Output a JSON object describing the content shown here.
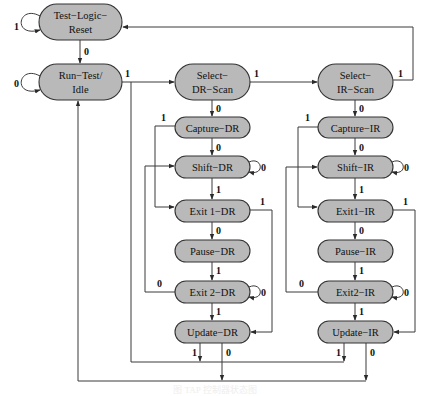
{
  "diagram": {
    "type": "state-machine",
    "states": [
      {
        "id": "tlr",
        "lines": [
          "Test−Logic−",
          "Reset"
        ]
      },
      {
        "id": "rti",
        "lines": [
          "Run−Test/",
          "Idle"
        ]
      },
      {
        "id": "sdr",
        "lines": [
          "Select−",
          "DR−Scan"
        ]
      },
      {
        "id": "cdr",
        "lines": [
          "Capture−DR"
        ]
      },
      {
        "id": "shdr",
        "lines": [
          "Shift−DR"
        ]
      },
      {
        "id": "e1dr",
        "lines": [
          "Exit 1−DR"
        ]
      },
      {
        "id": "pdr",
        "lines": [
          "Pause−DR"
        ]
      },
      {
        "id": "e2dr",
        "lines": [
          "Exit 2−DR"
        ]
      },
      {
        "id": "udr",
        "lines": [
          "Update−DR"
        ]
      },
      {
        "id": "sir",
        "lines": [
          "Select−",
          "IR−Scan"
        ]
      },
      {
        "id": "cir",
        "lines": [
          "Capture−IR"
        ]
      },
      {
        "id": "shir",
        "lines": [
          "Shift−IR"
        ]
      },
      {
        "id": "e1ir",
        "lines": [
          "Exit1−IR"
        ]
      },
      {
        "id": "pir",
        "lines": [
          "Pause−IR"
        ]
      },
      {
        "id": "e2ir",
        "lines": [
          "Exit2−IR"
        ]
      },
      {
        "id": "uir",
        "lines": [
          "Update−IR"
        ]
      }
    ],
    "transitions": [
      {
        "from": "tlr",
        "to": "tlr",
        "label": "1"
      },
      {
        "from": "tlr",
        "to": "rti",
        "label": "0"
      },
      {
        "from": "rti",
        "to": "rti",
        "label": "0"
      },
      {
        "from": "rti",
        "to": "sdr",
        "label": "1"
      },
      {
        "from": "sdr",
        "to": "sir",
        "label": "1"
      },
      {
        "from": "sdr",
        "to": "cdr",
        "label": "0"
      },
      {
        "from": "sir",
        "to": "tlr",
        "label": "1"
      },
      {
        "from": "sir",
        "to": "cir",
        "label": "0"
      },
      {
        "from": "cdr",
        "to": "shdr",
        "label": "0"
      },
      {
        "from": "cdr",
        "to": "e1dr",
        "label": "1"
      },
      {
        "from": "shdr",
        "to": "shdr",
        "label": "0"
      },
      {
        "from": "shdr",
        "to": "e1dr",
        "label": "1"
      },
      {
        "from": "e1dr",
        "to": "pdr",
        "label": "0"
      },
      {
        "from": "e1dr",
        "to": "udr",
        "label": "1"
      },
      {
        "from": "pdr",
        "to": "e2dr",
        "label": "1"
      },
      {
        "from": "e2dr",
        "to": "e2dr",
        "label": "0"
      },
      {
        "from": "e2dr",
        "to": "shdr",
        "label": "0"
      },
      {
        "from": "e2dr",
        "to": "udr",
        "label": "1"
      },
      {
        "from": "udr",
        "to": "sdr",
        "label": "1"
      },
      {
        "from": "udr",
        "to": "rti",
        "label": "0"
      },
      {
        "from": "cir",
        "to": "shir",
        "label": "0"
      },
      {
        "from": "cir",
        "to": "e1ir",
        "label": "1"
      },
      {
        "from": "shir",
        "to": "shir",
        "label": "0"
      },
      {
        "from": "shir",
        "to": "e1ir",
        "label": "1"
      },
      {
        "from": "e1ir",
        "to": "pir",
        "label": "0"
      },
      {
        "from": "e1ir",
        "to": "uir",
        "label": "1"
      },
      {
        "from": "pir",
        "to": "e2ir",
        "label": "1"
      },
      {
        "from": "e2ir",
        "to": "e2ir",
        "label": "0"
      },
      {
        "from": "e2ir",
        "to": "shir",
        "label": "0"
      },
      {
        "from": "e2ir",
        "to": "uir",
        "label": "1"
      },
      {
        "from": "uir",
        "to": "sdr",
        "label": "1"
      },
      {
        "from": "uir",
        "to": "rti",
        "label": "0"
      }
    ]
  },
  "labels": {
    "tlr_self": "1",
    "tlr_rti": "0",
    "rti_self": "0",
    "rti_sdr": "1",
    "sdr_sir": "1",
    "sdr_cdr": "0",
    "sir_tlr": "1",
    "sir_cir": "0",
    "cdr_shdr": "0",
    "cdr_e1dr": "1",
    "shdr_self": "0",
    "shdr_e1dr": "1",
    "e1dr_pdr": "0",
    "e1dr_udr": "1",
    "pdr_e2dr": "1",
    "e2dr_self": "0",
    "e2dr_shdr": "0",
    "e2dr_udr": "1",
    "udr_1": "1",
    "udr_0": "0",
    "cir_shir": "0",
    "cir_e1ir": "1",
    "shir_self": "0",
    "shir_e1ir": "1",
    "e1ir_pir": "0",
    "e1ir_uir": "1",
    "pir_e2ir": "1",
    "e2ir_self": "0",
    "e2ir_shir": "0",
    "e2ir_uir": "1",
    "uir_1": "1",
    "uir_0": "0"
  },
  "caption": "图  TAP 控制器状态图"
}
